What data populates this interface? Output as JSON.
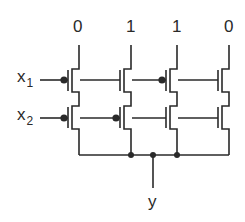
{
  "diagram": {
    "type": "NMOS ROM/PLA transistor array",
    "column_labels": [
      "0",
      "1",
      "1",
      "0"
    ],
    "inputs": [
      {
        "name": "x",
        "subscript": "1"
      },
      {
        "name": "x",
        "subscript": "2"
      }
    ],
    "output": {
      "label": "y"
    },
    "bubble_gates": [
      [
        true,
        false,
        true,
        false
      ],
      [
        true,
        true,
        false,
        false
      ]
    ],
    "colors": {
      "line": "#2a2a2a",
      "background": "#ffffff"
    }
  }
}
